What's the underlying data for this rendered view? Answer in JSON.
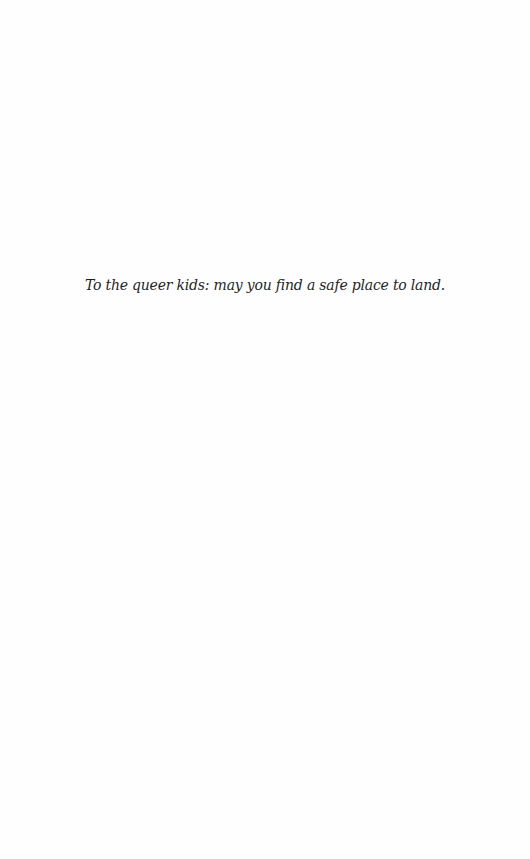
{
  "page": {
    "dedication": "To the queer kids: may you find a safe place to land."
  }
}
